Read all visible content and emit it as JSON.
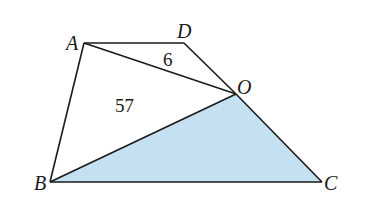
{
  "figure": {
    "points": {
      "A": {
        "label": "A",
        "x": 84,
        "y": 43
      },
      "D": {
        "label": "D",
        "x": 184,
        "y": 43
      },
      "O": {
        "label": "O",
        "x": 236,
        "y": 94
      },
      "B": {
        "label": "B",
        "x": 50,
        "y": 182
      },
      "C": {
        "label": "C",
        "x": 322,
        "y": 182
      }
    },
    "area_labels": {
      "AOD": "6",
      "AOB": "57"
    },
    "shaded_region": "BOC",
    "shade_color": "#c5e0f0",
    "line_color": "#1a1a1a"
  }
}
